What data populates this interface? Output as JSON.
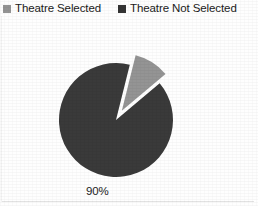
{
  "chart_data": {
    "type": "pie",
    "title": "",
    "subtitle": "",
    "xlabel": "",
    "ylabel": "",
    "grid": false,
    "legend_position": "top",
    "exploded_slice": "Theatre Selected",
    "slices": [
      {
        "label": "Theatre Selected",
        "value": 10,
        "display_label": "",
        "color": "#949494",
        "exploded": true
      },
      {
        "label": "Theatre Not Selected",
        "value": 90,
        "display_label": "90%",
        "color": "#3a3a3a",
        "exploded": false
      }
    ],
    "categories": [
      "Theatre Selected",
      "Theatre Not Selected"
    ],
    "values": [
      10,
      90
    ],
    "value_unit": "%",
    "annotations": [
      {
        "text": "90%",
        "refers_to": "Theatre Not Selected"
      }
    ]
  },
  "legend": {
    "entries": [
      {
        "label": "Theatre Selected",
        "color": "#949494"
      },
      {
        "label": "Theatre Not Selected",
        "color": "#333333"
      }
    ]
  },
  "labels": {
    "slice_90": "90%"
  },
  "colors": {
    "background": "#fefefe",
    "slice_selected": "#949494",
    "slice_not_selected": "#3a3a3a",
    "text": "#1b1b1b",
    "rule": "#e2e2e2"
  }
}
